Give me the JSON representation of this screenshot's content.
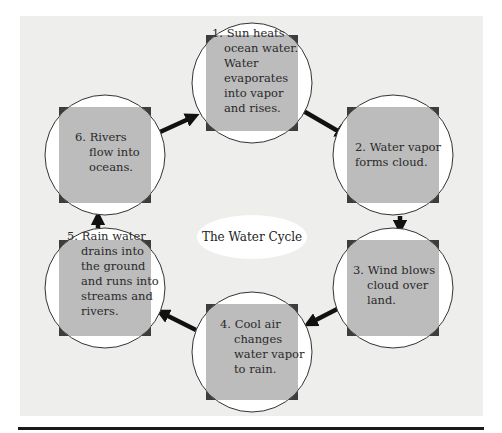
{
  "diagram": {
    "title": "The Water Cycle",
    "colors": {
      "panel": "#eeeeec",
      "square": "#3d3d3d",
      "circle_fill": "#ffffff",
      "text_box": "#bcbcbc",
      "arrow": "#111111"
    },
    "steps": [
      {
        "id": 1,
        "lines": [
          "1. Sun heats",
          "ocean water.",
          "Water",
          "evaporates",
          "into vapor",
          "and rises."
        ]
      },
      {
        "id": 2,
        "lines": [
          "2. Water vapor",
          "forms cloud."
        ]
      },
      {
        "id": 3,
        "lines": [
          "3. Wind blows",
          "cloud over",
          "land."
        ]
      },
      {
        "id": 4,
        "lines": [
          "4. Cool air",
          "changes",
          "water vapor",
          "to rain."
        ]
      },
      {
        "id": 5,
        "lines": [
          "5. Rain water",
          "drains into",
          "the ground",
          "and runs into",
          "streams and",
          "rivers."
        ]
      },
      {
        "id": 6,
        "lines": [
          "6. Rivers",
          "flow into",
          "oceans."
        ]
      }
    ],
    "flow": [
      [
        1,
        2
      ],
      [
        2,
        3
      ],
      [
        3,
        4
      ],
      [
        4,
        5
      ],
      [
        5,
        6
      ],
      [
        6,
        1
      ]
    ]
  }
}
